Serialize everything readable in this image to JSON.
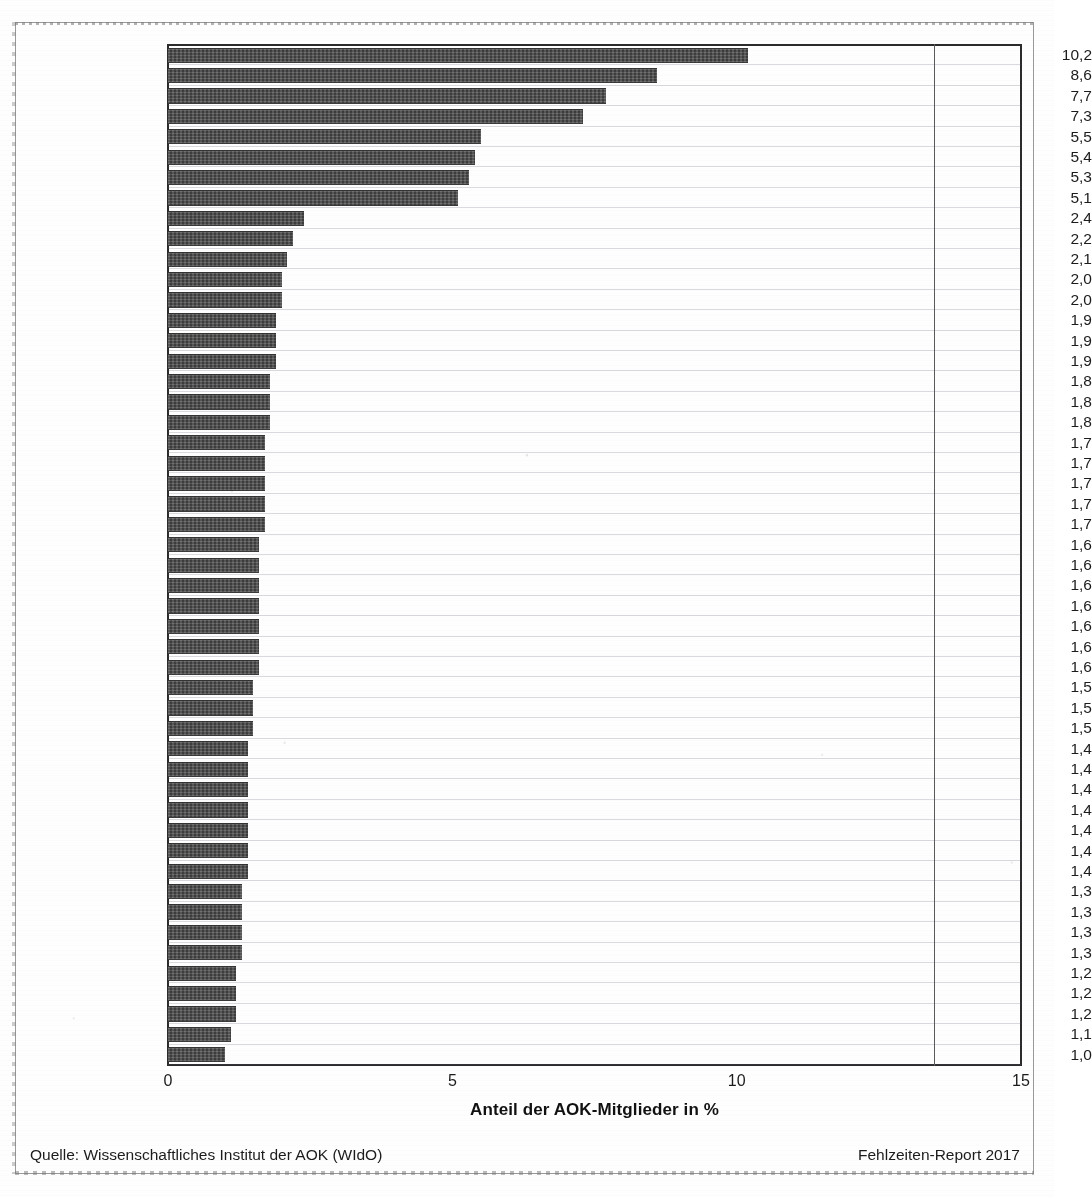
{
  "chart_data": {
    "type": "bar",
    "orientation": "horizontal",
    "title": "",
    "xlabel": "Anteil der AOK-Mitglieder in %",
    "ylabel": "",
    "xlim": [
      0,
      15
    ],
    "xticks": [
      "0",
      "5",
      "10",
      "15"
    ],
    "xtick_values": [
      0,
      5,
      10,
      15
    ],
    "grid": true,
    "legend": null,
    "value_label_format": "comma-decimal",
    "bar_color": "#4a4a4a",
    "categories": [
      "Dresden",
      "Chemnitz",
      "Leipzig",
      "Erfurt",
      "Rostock",
      "Halle",
      "Magdeburg",
      "Potsdam",
      "Braunschweig",
      "Berlin",
      "Bielefeld",
      "Oldenburg",
      "Lübeck",
      "Solingen",
      "Hannover",
      "Münster",
      "Hamburg",
      "Nürnberg",
      "Leverkusen",
      "Stuttgart",
      "Karlsruhe",
      "Osnabrück",
      "Kiel",
      "Wiesbaden",
      "Bremen",
      "Hamm",
      "Essen",
      "Frankfurt",
      "Freiburg",
      "Wuppertal",
      "Kassel",
      "Mannheim",
      "Oberhausen",
      "Augsburg",
      "München",
      "Krefeld",
      "Dortmund",
      "Düsseldorf",
      "Mülheim",
      "Ludwigshafen",
      "Aachen",
      "Mainz",
      "Bonn",
      "Bochum",
      "Mönchengladbach",
      "Hagen",
      "Köln",
      "Saarbrücken",
      "Duisburg",
      "Gelsenkirchen"
    ],
    "values": [
      10.2,
      8.6,
      7.7,
      7.3,
      5.5,
      5.4,
      5.3,
      5.1,
      2.4,
      2.2,
      2.1,
      2.0,
      2.0,
      1.9,
      1.9,
      1.9,
      1.8,
      1.8,
      1.8,
      1.7,
      1.7,
      1.7,
      1.7,
      1.7,
      1.6,
      1.6,
      1.6,
      1.6,
      1.6,
      1.6,
      1.6,
      1.5,
      1.5,
      1.5,
      1.4,
      1.4,
      1.4,
      1.4,
      1.4,
      1.4,
      1.4,
      1.3,
      1.3,
      1.3,
      1.3,
      1.2,
      1.2,
      1.2,
      1.1,
      1.0
    ],
    "value_labels": [
      "10,2",
      "8,6",
      "7,7",
      "7,3",
      "5,5",
      "5,4",
      "5,3",
      "5,1",
      "2,4",
      "2,2",
      "2,1",
      "2,0",
      "2,0",
      "1,9",
      "1,9",
      "1,9",
      "1,8",
      "1,8",
      "1,8",
      "1,7",
      "1,7",
      "1,7",
      "1,7",
      "1,7",
      "1,6",
      "1,6",
      "1,6",
      "1,6",
      "1,6",
      "1,6",
      "1,6",
      "1,5",
      "1,5",
      "1,5",
      "1,4",
      "1,4",
      "1,4",
      "1,4",
      "1,4",
      "1,4",
      "1,4",
      "1,3",
      "1,3",
      "1,3",
      "1,3",
      "1,2",
      "1,2",
      "1,2",
      "1,1",
      "1,0"
    ]
  },
  "footer": {
    "source": "Quelle: Wissenschaftliches Institut der AOK (WIdO)",
    "report": "Fehlzeiten-Report 2017"
  }
}
